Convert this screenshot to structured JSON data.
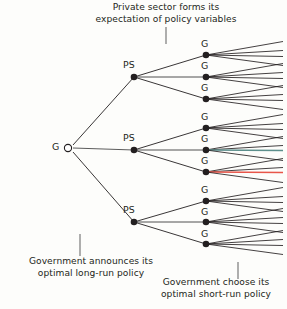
{
  "figure": {
    "background_color": "#fdfdfb",
    "line_color": "#231f20",
    "accent_red": "#e8564a",
    "accent_teal": "#5d8f8c"
  },
  "captions": {
    "top": "Private sector forms its\nexpectation of policy variables",
    "bottom_left": "Government announces its\noptimal long-run policy",
    "bottom_right": "Government choose its\noptimal short-run policy"
  },
  "nodes": {
    "root": {
      "label": "G",
      "x": 68,
      "y": 148,
      "type": "open-circle"
    },
    "private_sector": [
      {
        "label": "PS",
        "x": 134,
        "y": 77
      },
      {
        "label": "PS",
        "x": 134,
        "y": 150
      },
      {
        "label": "PS",
        "x": 134,
        "y": 222
      }
    ],
    "government_second_stage": [
      {
        "label": "G",
        "x": 206,
        "y": 55
      },
      {
        "label": "G",
        "x": 206,
        "y": 77
      },
      {
        "label": "G",
        "x": 206,
        "y": 99
      },
      {
        "label": "G",
        "x": 206,
        "y": 128
      },
      {
        "label": "G",
        "x": 206,
        "y": 150
      },
      {
        "label": "G",
        "x": 206,
        "y": 172
      },
      {
        "label": "G",
        "x": 206,
        "y": 201
      },
      {
        "label": "G",
        "x": 206,
        "y": 222
      },
      {
        "label": "G",
        "x": 206,
        "y": 244
      }
    ]
  },
  "chart_data": {
    "type": "tree-diagram",
    "stages": [
      {
        "name": "Government announces its optimal long-run policy",
        "actor": "G",
        "branch_count": 3
      },
      {
        "name": "Private sector forms its expectation of policy variables",
        "actor": "PS",
        "branch_count": 3
      },
      {
        "name": "Government choose its optimal short-run policy",
        "actor": "G",
        "branch_count": 4
      }
    ],
    "total_terminal_branches": 36,
    "highlighted_paths": [
      {
        "color": "#e8564a",
        "from_node_index": 5,
        "note": "red terminal branch from sixth G node"
      },
      {
        "color": "#5d8f8c",
        "from_node_index": 4,
        "note": "teal terminal branch from fifth G node"
      }
    ]
  }
}
